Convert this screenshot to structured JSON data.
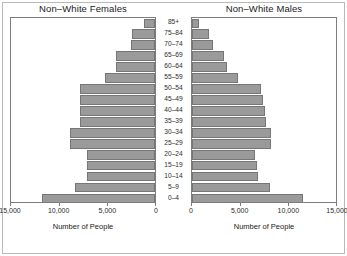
{
  "figure": {
    "panels": [
      {
        "id": "female",
        "title": "Non–White Females",
        "axis_title": "Number of People"
      },
      {
        "id": "male",
        "title": "Non–White Males",
        "axis_title": "Number of People"
      }
    ]
  },
  "axis": {
    "female_ticks": [
      "15,000",
      "10,000",
      "5,000",
      "0"
    ],
    "male_ticks": [
      "0",
      "5,000",
      "10,000",
      "15,000"
    ],
    "max": 15000,
    "tick_values": [
      0,
      5000,
      10000,
      15000
    ]
  },
  "colors": {
    "bar_fill": "#9a9a9a",
    "bar_border": "#767676",
    "plot_border": "#7d7d7d",
    "outer_frame": "#b9b9b9",
    "text": "#1a1a1a",
    "background": "#ffffff"
  },
  "chart_data": {
    "type": "bar",
    "xlabel": "Number of People",
    "ylabel": "Age Group",
    "xlim": [
      0,
      15000
    ],
    "grid": false,
    "legend": "none",
    "orientation": "horizontal",
    "layout": "population-pyramid",
    "categories": [
      "85+",
      "75–84",
      "70–74",
      "65–69",
      "60–64",
      "55–59",
      "50–54",
      "45–49",
      "40–44",
      "35–39",
      "30–34",
      "25–29",
      "20–24",
      "15–19",
      "10–14",
      "5–9",
      "0–4"
    ],
    "series": [
      {
        "name": "Non–White Females",
        "direction": "left",
        "values": [
          1100,
          2400,
          2500,
          4000,
          4000,
          5100,
          7700,
          7700,
          7700,
          7700,
          8700,
          8700,
          7000,
          7000,
          7000,
          8200,
          11600
        ]
      },
      {
        "name": "Non–White Males",
        "direction": "right",
        "values": [
          700,
          1700,
          2200,
          3300,
          3600,
          4700,
          7100,
          7300,
          7500,
          7600,
          8100,
          8100,
          6500,
          6700,
          6800,
          8000,
          11400
        ]
      }
    ]
  }
}
